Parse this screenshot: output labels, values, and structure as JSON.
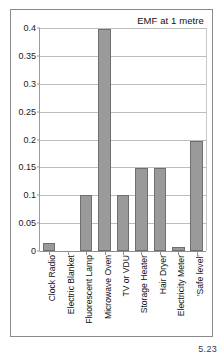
{
  "figure": {
    "page_number": "5.23"
  },
  "chart_data": {
    "type": "bar",
    "title": "EMF at 1 metre",
    "xlabel": "",
    "ylabel": "",
    "ylim": [
      0,
      0.4
    ],
    "grid": true,
    "legend": false,
    "yticks": [
      "0",
      "0.05",
      "0.1",
      "0.15",
      "0.2",
      "0.25",
      "0.3",
      "0.35",
      "0.4"
    ],
    "ytick_values": [
      0,
      0.05,
      0.1,
      0.15,
      0.2,
      0.25,
      0.3,
      0.35,
      0.4
    ],
    "categories": [
      "Clock Radio",
      "Electric Blanket",
      "Fluorescent Lamp",
      "Microwave Oven",
      "TV or VDU",
      "Storage Heater",
      "Hair Dryer",
      "Electricity Meter",
      "'Safe level'"
    ],
    "values": [
      0.015,
      0,
      0.1,
      0.398,
      0.1,
      0.149,
      0.149,
      0.008,
      0.198
    ],
    "bar_color": "#9a9a9a",
    "bar_edge_color": "#6f6f6f",
    "grid_color": "#bdbdbd",
    "axis_color": "#8f8f8f",
    "text_color": "#111111"
  }
}
